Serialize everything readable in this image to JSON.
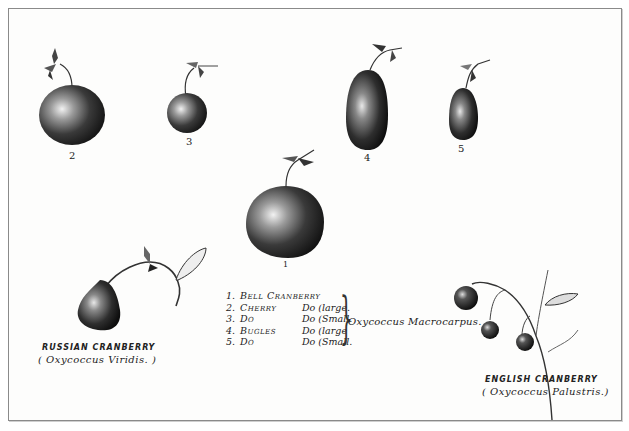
{
  "plate": {
    "type": "botanical-illustration",
    "subject": "Cranberry varieties"
  },
  "figures": [
    {
      "id": "fig-2",
      "number": "2"
    },
    {
      "id": "fig-3",
      "number": "3"
    },
    {
      "id": "fig-4",
      "number": "4"
    },
    {
      "id": "fig-5",
      "number": "5"
    },
    {
      "id": "fig-1",
      "number": "1"
    }
  ],
  "legend": {
    "rows": [
      {
        "n": "1.",
        "name": "Bell Cranberry",
        "size": ""
      },
      {
        "n": "2.",
        "name": "Cherry",
        "size": "Do (large."
      },
      {
        "n": "3.",
        "name": "Do",
        "size": "Do (Small."
      },
      {
        "n": "4.",
        "name": "Bugles",
        "size": "Do (large"
      },
      {
        "n": "5.",
        "name": "Do",
        "size": "Do (Small."
      }
    ],
    "brace": "}",
    "genus": "Oxycoccus Macrocarpus."
  },
  "russian": {
    "title": "RUSSIAN CRANBERRY",
    "latin": "( Oxycoccus Viridis. )"
  },
  "english": {
    "title": "ENGLISH CRANBERRY",
    "latin": "( Oxycoccus Palustris.)"
  }
}
